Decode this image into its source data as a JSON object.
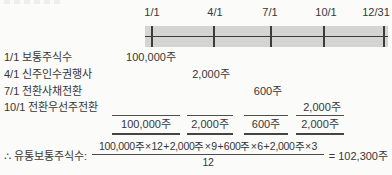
{
  "timeline": {
    "labels": [
      "1/1",
      "4/1",
      "7/1",
      "10/1",
      "12/31"
    ]
  },
  "rows": [
    {
      "label": "1/1 보통주식수",
      "value": "100,000주"
    },
    {
      "label": "4/1 신주인수권행사",
      "value": "2,000주"
    },
    {
      "label": "7/1 전환사채전환",
      "value": "600주"
    },
    {
      "label": "10/1 전환우선주전환",
      "value": "2,000주"
    }
  ],
  "totals": [
    "100,000주",
    "2,000주",
    "600주",
    "2,000주"
  ],
  "formula": {
    "label": "∴ 유통보통주식수:",
    "numerator": "100,000주 × 12 + 2,000주 × 9 + 600주 × 6 + 2,000주 × 3",
    "denominator": "12",
    "result": "= 102,300주"
  },
  "colors": {
    "background": "#fbfbfa",
    "text": "#363636",
    "timeline_bar": "#d4d4d3",
    "timeline_line": "#3c3c3c",
    "rule": "#4a4a4a"
  }
}
